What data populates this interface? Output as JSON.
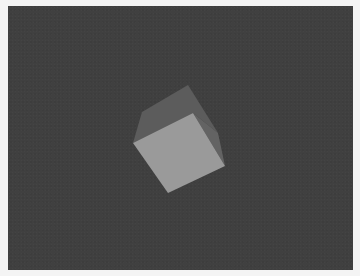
{
  "scene": {
    "description": "Rendered 3D cube on dark gray background",
    "colors": {
      "border": "#f4f4f4",
      "background": "#404040",
      "top_face": "#5c5c5c",
      "side_face": "#626262",
      "front_face": "#9a9a9a"
    },
    "cube": {
      "top_face": "188,85 142,112 133,143 193,113 218,133",
      "side_face": "193,113 218,133 225,166",
      "front_face": "133,143 193,113 225,166 168,193"
    }
  }
}
